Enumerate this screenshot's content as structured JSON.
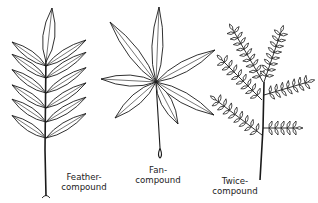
{
  "diagram": {
    "labels": {
      "feather": [
        "Feather-",
        "compound"
      ],
      "fan": [
        "Fan-",
        "compound"
      ],
      "twice": [
        "Twice-",
        "compound"
      ]
    },
    "ink_color": "#1a1a1a",
    "paper_color": "#ffffff"
  }
}
